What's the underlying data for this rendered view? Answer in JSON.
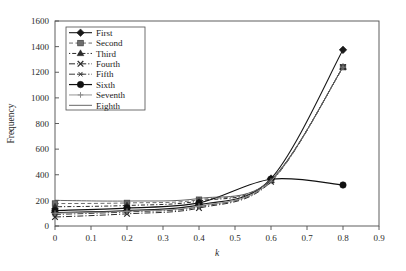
{
  "chart_data": {
    "type": "line",
    "title": "",
    "xlabel": "k",
    "ylabel": "Frequency",
    "xlim": [
      0,
      0.9
    ],
    "ylim": [
      0,
      1600
    ],
    "xticks": [
      "0",
      "0.1",
      "0.2",
      "0.3",
      "0.4",
      "0.5",
      "0.6",
      "0.7",
      "0.8",
      "0.9"
    ],
    "yticks": [
      "0",
      "200",
      "400",
      "600",
      "800",
      "1000",
      "1200",
      "1400",
      "1600"
    ],
    "xtick_values": [
      0,
      0.1,
      0.2,
      0.3,
      0.4,
      0.5,
      0.6,
      0.7,
      0.8,
      0.9
    ],
    "ytick_values": [
      0,
      200,
      400,
      600,
      800,
      1000,
      1200,
      1400,
      1600
    ],
    "grid": false,
    "legend_position": "upper-left-inside",
    "x": [
      0,
      0.2,
      0.4,
      0.6,
      0.8
    ],
    "series": [
      {
        "name": "First",
        "values": [
          105,
          120,
          165,
          370,
          1375
        ],
        "marker": "diamond",
        "dash": "solid",
        "color": "#1a1a1a",
        "width": 1.1
      },
      {
        "name": "Second",
        "values": [
          175,
          180,
          205,
          360,
          1240
        ],
        "marker": "square",
        "dash": "dashed",
        "color": "#6e6e6e",
        "width": 1.0
      },
      {
        "name": "Third",
        "values": [
          150,
          160,
          195,
          355,
          1240
        ],
        "marker": "triangle",
        "dash": "dash-dot",
        "color": "#2b2b2b",
        "width": 1.0
      },
      {
        "name": "Fourth",
        "values": [
          70,
          95,
          140,
          345,
          1240
        ],
        "marker": "cross-x",
        "dash": "dash-dot-long",
        "color": "#2b2b2b",
        "width": 1.0
      },
      {
        "name": "Fifth",
        "values": [
          90,
          110,
          150,
          350,
          1240
        ],
        "marker": "asterisk",
        "dash": "dash-dot-long",
        "color": "#3a3a3a",
        "width": 1.0
      },
      {
        "name": "Sixth",
        "values": [
          120,
          140,
          180,
          365,
          320
        ],
        "marker": "circle",
        "dash": "solid",
        "color": "#111111",
        "width": 1.2
      },
      {
        "name": "Seventh",
        "values": [
          100,
          115,
          155,
          350,
          1240
        ],
        "marker": "plus",
        "dash": "solid",
        "color": "#8a8a8a",
        "width": 0.9
      },
      {
        "name": "Eighth",
        "values": [
          200,
          195,
          215,
          360,
          1240
        ],
        "marker": "none",
        "dash": "solid",
        "color": "#555555",
        "width": 0.9
      }
    ]
  },
  "legend": {
    "items": [
      {
        "label": "First"
      },
      {
        "label": "Second"
      },
      {
        "label": "Third"
      },
      {
        "label": "Fourth"
      },
      {
        "label": "Fifth"
      },
      {
        "label": "Sixth"
      },
      {
        "label": "Seventh"
      },
      {
        "label": "Eighth"
      }
    ]
  },
  "axes": {
    "x_title": "k",
    "y_title": "Frequency"
  },
  "colors": {
    "frame": "#4d4d4d",
    "text": "#2b2b2b",
    "background": "#ffffff"
  }
}
